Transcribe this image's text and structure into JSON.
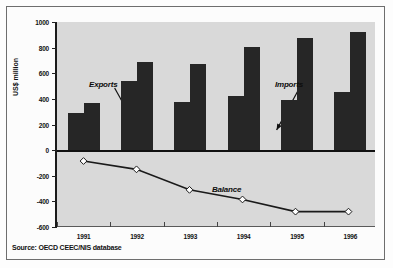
{
  "chart_data": {
    "type": "bar",
    "title": "",
    "subtitle": "",
    "xlabel": "",
    "ylabel": "US$ million",
    "categories": [
      "1991",
      "1992",
      "1993",
      "1994",
      "1995",
      "1996"
    ],
    "ylim": [
      -600,
      1000
    ],
    "yticks": [
      1000,
      800,
      600,
      400,
      200,
      0,
      -200,
      -400,
      -600
    ],
    "ytick_labels": [
      "1000",
      "800",
      "600",
      "400",
      "200",
      "0",
      "-200",
      "-400",
      "-600"
    ],
    "grid": false,
    "legend_position": "inline-annotations",
    "series": [
      {
        "name": "Exports",
        "type": "bar",
        "values": [
          290,
          540,
          375,
          425,
          390,
          450
        ]
      },
      {
        "name": "Imports",
        "type": "bar",
        "values": [
          370,
          685,
          675,
          805,
          875,
          925
        ]
      },
      {
        "name": "Balance",
        "type": "line",
        "values": [
          -85,
          -150,
          -310,
          -385,
          -480,
          -480
        ]
      }
    ],
    "annotations": [
      {
        "label": "Exports",
        "target_series": "Exports"
      },
      {
        "label": "Imports",
        "target_series": "Imports"
      },
      {
        "label": "Balance",
        "target_series": "Balance"
      }
    ],
    "source": "Source: OECD CEEC/NIS database",
    "colors": {
      "bar": "#262626",
      "line": "#1a1a1a",
      "marker_fill": "#ffffff",
      "plot_background": "#d9d9d9",
      "axis": "#111111"
    }
  }
}
